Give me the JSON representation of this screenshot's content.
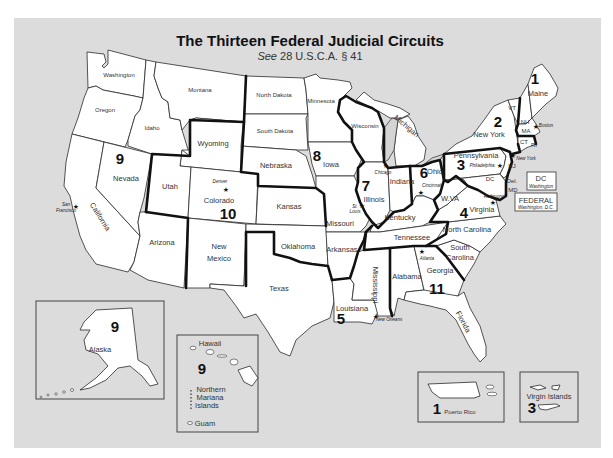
{
  "title": "The Thirteen Federal Judicial Circuits",
  "subtitle": "See 28 U.S.C.A. § 41",
  "subtitle_italic_prefix": "See",
  "subtitle_rest": " 28 U.S.C.A. § 41",
  "states": {
    "washington": "Washington",
    "oregon": "Oregon",
    "california": "California",
    "nevada": "Nevada",
    "idaho": "Idaho",
    "montana": "Montana",
    "wyoming": "Wyoming",
    "utah": "Utah",
    "arizona": "Arizona",
    "colorado": "Colorado",
    "new_mexico_1": "New",
    "new_mexico_2": "Mexico",
    "north_dakota": "North Dakota",
    "south_dakota": "South Dakota",
    "nebraska": "Nebraska",
    "kansas": "Kansas",
    "oklahoma": "Oklahoma",
    "texas": "Texas",
    "minnesota": "Minnesota",
    "iowa": "Iowa",
    "missouri": "Missouri",
    "arkansas": "Arkansas",
    "louisiana": "Louisiana",
    "wisconsin": "Wisconsin",
    "illinois": "Illinois",
    "indiana": "Indiana",
    "michigan": "Michigan",
    "kentucky": "Kentucky",
    "tennessee": "Tennessee",
    "mississippi": "Mississippi",
    "alabama": "Alabama",
    "georgia": "Georgia",
    "florida": "Florida",
    "ohio": "Ohio",
    "west_virginia": "W.VA",
    "virginia": "Virginia",
    "north_carolina": "North Carolina",
    "south_carolina_1": "South",
    "south_carolina_2": "Carolina",
    "pennsylvania": "Pennsylvania",
    "new_york": "New York",
    "new_jersey": "NJ",
    "delaware": "Del.",
    "maryland": "MD",
    "vermont": "VT",
    "new_hampshire": "NH",
    "massachusetts": "MA",
    "connecticut": "CT",
    "rhode_island": "RI",
    "maine": "Maine",
    "dc": "DC",
    "alaska": "Alaska",
    "hawaii": "Hawaii",
    "northern_mariana_1": "Northern",
    "northern_mariana_2": "Mariana",
    "northern_mariana_3": "Islands",
    "guam": "Guam",
    "puerto_rico": "Puerto Rico",
    "virgin_islands": "Virgin Islands"
  },
  "cities": {
    "san_francisco_1": "San",
    "san_francisco_2": "Francisco",
    "denver": "Denver",
    "chicago": "Chicago",
    "st_louis_1": "St.",
    "st_louis_2": "Louis",
    "cincinnati": "Cincinnati",
    "new_orleans": "New Orleans",
    "atlanta": "Atlanta",
    "richmond": "Richmond",
    "philadelphia": "Philadelphia",
    "new_york": "New York",
    "boston": "Boston"
  },
  "city_marker": "★",
  "circuits": {
    "c1": "1",
    "c2": "2",
    "c3": "3",
    "c4": "4",
    "c5": "5",
    "c6": "6",
    "c7": "7",
    "c8": "8",
    "c9": "9",
    "c10": "10",
    "c11": "11",
    "c9_alaska": "9",
    "c9_pacific": "9",
    "c1_pr": "1",
    "c3_vi": "3"
  },
  "boxes": {
    "dc_title": "DC",
    "dc_sub": "Washington",
    "federal_title": "FEDERAL",
    "federal_sub": "Washington, D.C."
  },
  "colors": {
    "water": "#dcdcdc",
    "land": "#ffffff",
    "circuit_border": "#111111"
  }
}
